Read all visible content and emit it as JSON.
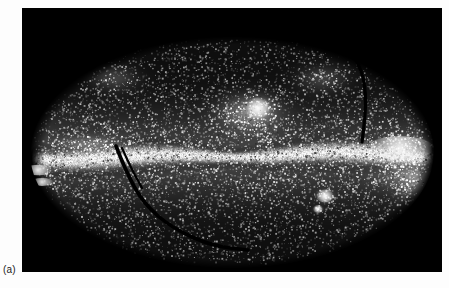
{
  "figure": {
    "label": "(a)",
    "panel_background": "#000000",
    "page_background": "#fdfdfd",
    "panel": {
      "x": 22,
      "y": 8,
      "width": 420,
      "height": 264
    }
  },
  "chart_data": {
    "type": "heatmap",
    "title": "",
    "subtitle": "",
    "xlabel": "",
    "ylabel": "",
    "projection": "mollweide-ellipse",
    "grid": false,
    "legend": null,
    "colormap": {
      "low": "#000000",
      "mid": "#9a9a9a",
      "high": "#ffffff"
    },
    "ellipse": {
      "cx": 210,
      "cy": 144,
      "rx": 202,
      "ry": 116
    },
    "point_sources": {
      "count": 26000,
      "size_min_px": 0.6,
      "size_max_px": 1.9,
      "brightness_min": 0.18,
      "brightness_max": 1.0
    },
    "bands": [
      {
        "name": "galactic-plane",
        "kind": "bright-horizontal-band",
        "center_y": 148,
        "half_width_px": 9,
        "peak_brightness": 1.0,
        "x_from": 4,
        "x_to": 416
      },
      {
        "name": "galactic-halo",
        "kind": "broad-diffuse-band",
        "center_y": 148,
        "half_width_px": 42,
        "peak_brightness": 0.46
      }
    ],
    "blobs": [
      {
        "name": "clumpy-cloud-upper-center",
        "cx": 228,
        "cy": 104,
        "rx": 28,
        "ry": 17,
        "brightness": 0.82
      },
      {
        "name": "bright-knot-upper-center",
        "cx": 236,
        "cy": 100,
        "rx": 10,
        "ry": 8,
        "brightness": 0.95
      },
      {
        "name": "bright-streak-left-upper",
        "cx": 16,
        "cy": 162,
        "rx": 11,
        "ry": 4,
        "brightness": 0.9
      },
      {
        "name": "bright-streak-left-lower",
        "cx": 20,
        "cy": 174,
        "rx": 9,
        "ry": 3,
        "brightness": 0.85
      },
      {
        "name": "compact-source-lower-center",
        "cx": 303,
        "cy": 188,
        "rx": 7,
        "ry": 5,
        "brightness": 1.0
      },
      {
        "name": "compact-source-lower-center-small",
        "cx": 296,
        "cy": 201,
        "rx": 4,
        "ry": 3,
        "brightness": 0.95
      },
      {
        "name": "diffuse-cloud-right",
        "cx": 390,
        "cy": 158,
        "rx": 30,
        "ry": 22,
        "brightness": 0.75
      },
      {
        "name": "bright-ridge-right",
        "cx": 378,
        "cy": 140,
        "rx": 26,
        "ry": 9,
        "brightness": 0.88
      },
      {
        "name": "faint-cloud-right-lower",
        "cx": 400,
        "cy": 182,
        "rx": 18,
        "ry": 14,
        "brightness": 0.6
      },
      {
        "name": "faint-patch-upper-left",
        "cx": 92,
        "cy": 70,
        "rx": 22,
        "ry": 12,
        "brightness": 0.42
      },
      {
        "name": "faint-patch-upper-right",
        "cx": 300,
        "cy": 70,
        "rx": 24,
        "ry": 13,
        "brightness": 0.4
      },
      {
        "name": "bright-wisp-left-plane",
        "cx": 70,
        "cy": 138,
        "rx": 30,
        "ry": 8,
        "brightness": 0.8
      }
    ],
    "scan_gaps": [
      {
        "name": "scan-gap-upper-right",
        "kind": "dark-arc",
        "points": [
          [
            330,
            44
          ],
          [
            340,
            62
          ],
          [
            344,
            86
          ],
          [
            343,
            110
          ],
          [
            340,
            134
          ]
        ],
        "width_px": 3.2
      },
      {
        "name": "scan-gap-lower-left",
        "kind": "dark-arc",
        "points": [
          [
            94,
            138
          ],
          [
            104,
            164
          ],
          [
            122,
            196
          ],
          [
            150,
            220
          ],
          [
            190,
            238
          ],
          [
            226,
            242
          ]
        ],
        "width_px": 3.6
      },
      {
        "name": "scan-gap-lower-left-short",
        "kind": "dark-arc",
        "points": [
          [
            100,
            140
          ],
          [
            108,
            158
          ],
          [
            120,
            180
          ]
        ],
        "width_px": 2.2
      }
    ]
  }
}
